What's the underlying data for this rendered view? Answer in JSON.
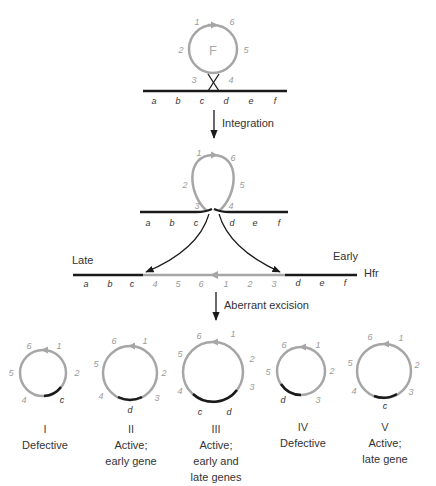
{
  "stage1": {
    "plasmid_label": "F",
    "plasmid_positions": [
      "1",
      "2",
      "3",
      "4",
      "5",
      "6"
    ],
    "chromosome_genes": [
      "a",
      "b",
      "c",
      "d",
      "e",
      "f"
    ]
  },
  "step1_label": "Integration",
  "stage2": {
    "plasmid_positions": [
      "1",
      "2",
      "3",
      "4",
      "5",
      "6"
    ],
    "chromosome_genes": [
      "a",
      "b",
      "c",
      "d",
      "e",
      "f"
    ]
  },
  "hfr": {
    "late_label": "Late",
    "early_label": "Early",
    "strain_label": "Hfr",
    "left_genes": [
      "a",
      "b",
      "c"
    ],
    "inserted_positions": [
      "4",
      "5",
      "6",
      "1",
      "2",
      "3"
    ],
    "right_genes": [
      "d",
      "e",
      "f"
    ]
  },
  "step2_label": "Aberrant excision",
  "products": [
    {
      "numeral": "I",
      "desc_lines": [
        "Defective"
      ],
      "positions": [
        "1",
        "2",
        "4",
        "5",
        "6"
      ],
      "genes": [
        "c"
      ]
    },
    {
      "numeral": "II",
      "desc_lines": [
        "Active;",
        "early gene"
      ],
      "positions": [
        "1",
        "2",
        "3",
        "4",
        "5",
        "6"
      ],
      "genes": [
        "d"
      ]
    },
    {
      "numeral": "III",
      "desc_lines": [
        "Active;",
        "early and",
        "late genes"
      ],
      "positions": [
        "1",
        "2",
        "3",
        "4",
        "5",
        "6"
      ],
      "genes": [
        "c",
        "d"
      ]
    },
    {
      "numeral": "IV",
      "desc_lines": [
        "Defective"
      ],
      "positions": [
        "1",
        "2",
        "3",
        "5",
        "6"
      ],
      "genes": [
        "d"
      ]
    },
    {
      "numeral": "V",
      "desc_lines": [
        "Active;",
        "late gene"
      ],
      "positions": [
        "1",
        "2",
        "3",
        "4",
        "5",
        "6"
      ],
      "genes": [
        "c"
      ]
    }
  ],
  "colors": {
    "plasmid": "#a6a6a6",
    "chromosome": "#1a1a1a",
    "arrow": "#1a1a1a"
  }
}
